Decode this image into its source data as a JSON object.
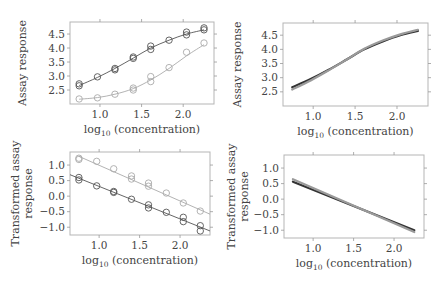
{
  "figure": {
    "xlabel_main": "log",
    "xlabel_sub": "10",
    "xlabel_rest": " (concentration)"
  },
  "chart_data": [
    {
      "id": "top-left",
      "type": "scatter",
      "title": "",
      "xlabel": "log10 (concentration)",
      "ylabel": [
        "Assay response"
      ],
      "xlim": [
        0.64,
        2.37
      ],
      "ylim": [
        2.0,
        4.93
      ],
      "xticks": [
        1.0,
        1.5,
        2.0
      ],
      "xtick_labels": [
        "1.0",
        "1.5",
        "2.0"
      ],
      "yticks": [
        2.5,
        3.0,
        3.5,
        4.0,
        4.5
      ],
      "ytick_labels": [
        "2.5",
        "3.0",
        "3.5",
        "4.0",
        "4.5"
      ],
      "grid": false,
      "box": {
        "x": 70,
        "y": 22,
        "w": 144,
        "h": 82
      },
      "series": [
        {
          "name": "reference",
          "color": "#555555",
          "marker": "circle",
          "fit": "logistic",
          "x": [
            0.75,
            0.75,
            0.97,
            1.18,
            1.18,
            1.4,
            1.4,
            1.61,
            1.61,
            1.83,
            2.04,
            2.04,
            2.25,
            2.25
          ],
          "y": [
            2.65,
            2.72,
            2.97,
            3.22,
            3.27,
            3.63,
            3.68,
            3.95,
            4.07,
            4.28,
            4.47,
            4.57,
            4.65,
            4.72
          ],
          "curve_x": [
            0.75,
            0.97,
            1.18,
            1.4,
            1.61,
            1.83,
            2.04,
            2.25
          ],
          "curve_y": [
            2.66,
            2.95,
            3.27,
            3.64,
            4.0,
            4.28,
            4.5,
            4.65
          ]
        },
        {
          "name": "test",
          "color": "#aaaaaa",
          "marker": "circle",
          "fit": "logistic",
          "x": [
            0.75,
            0.97,
            1.18,
            1.4,
            1.4,
            1.61,
            1.61,
            1.83,
            2.04,
            2.25
          ],
          "y": [
            2.18,
            2.22,
            2.35,
            2.5,
            2.57,
            2.8,
            2.98,
            3.3,
            3.85,
            4.18
          ],
          "curve_x": [
            0.75,
            0.97,
            1.18,
            1.4,
            1.61,
            1.83,
            2.04,
            2.25
          ],
          "curve_y": [
            2.17,
            2.23,
            2.35,
            2.55,
            2.86,
            3.27,
            3.72,
            4.12
          ]
        }
      ]
    },
    {
      "id": "top-right",
      "type": "line",
      "title": "",
      "xlabel": "log10 (concentration)",
      "ylabel": [
        "Assay response"
      ],
      "xlim": [
        0.64,
        2.37
      ],
      "ylim": [
        2.0,
        4.93
      ],
      "xticks": [
        1.0,
        1.5,
        2.0
      ],
      "xtick_labels": [
        "1.0",
        "1.5",
        "2.0"
      ],
      "yticks": [
        2.5,
        3.0,
        3.5,
        4.0,
        4.5
      ],
      "ytick_labels": [
        "2.5",
        "3.0",
        "3.5",
        "4.0",
        "4.5"
      ],
      "grid": false,
      "box": {
        "x": 283,
        "y": 23,
        "w": 145,
        "h": 83
      },
      "series": [
        {
          "name": "reference",
          "color": "#333333",
          "width": 2.2,
          "x": [
            0.75,
            0.97,
            1.18,
            1.4,
            1.61,
            1.83,
            2.04,
            2.25
          ],
          "y": [
            2.66,
            2.95,
            3.27,
            3.64,
            4.0,
            4.28,
            4.5,
            4.65
          ]
        },
        {
          "name": "test (shifted)",
          "color": "#9a9a9a",
          "width": 2.2,
          "x": [
            0.75,
            0.97,
            1.18,
            1.4,
            1.61,
            1.83,
            2.04,
            2.25
          ],
          "y": [
            2.58,
            2.9,
            3.25,
            3.64,
            4.02,
            4.31,
            4.53,
            4.69
          ]
        }
      ]
    },
    {
      "id": "bottom-left",
      "type": "scatter",
      "title": "",
      "xlabel": "log10 (concentration)",
      "ylabel": [
        "Transformed assay",
        "response"
      ],
      "xlim": [
        0.64,
        2.37
      ],
      "ylim": [
        -1.25,
        1.42
      ],
      "xticks": [
        1.0,
        1.5,
        2.0
      ],
      "xtick_labels": [
        "1.0",
        "1.5",
        "2.0"
      ],
      "yticks": [
        -1.0,
        -0.5,
        0.0,
        0.5,
        1.0
      ],
      "ytick_labels": [
        "−1.0",
        "−0.5",
        "0.0",
        "0.5",
        "1.0"
      ],
      "grid": false,
      "box": {
        "x": 70,
        "y": 152,
        "w": 140,
        "h": 83
      },
      "series": [
        {
          "name": "reference",
          "color": "#555555",
          "marker": "circle",
          "fit": "linear",
          "x": [
            0.75,
            0.75,
            0.97,
            1.18,
            1.18,
            1.4,
            1.61,
            1.61,
            1.83,
            2.04,
            2.04,
            2.25,
            2.25
          ],
          "y": [
            0.6,
            0.52,
            0.33,
            0.15,
            0.12,
            -0.1,
            -0.28,
            -0.38,
            -0.52,
            -0.68,
            -0.82,
            -0.95,
            -1.12
          ],
          "curve_x": [
            0.64,
            2.37
          ],
          "curve_y": [
            0.69,
            -1.12
          ]
        },
        {
          "name": "test",
          "color": "#aaaaaa",
          "marker": "circle",
          "fit": "linear",
          "x": [
            0.75,
            0.75,
            0.97,
            1.18,
            1.4,
            1.4,
            1.61,
            1.61,
            1.83,
            2.04,
            2.25
          ],
          "y": [
            1.22,
            1.18,
            1.12,
            0.88,
            0.65,
            0.55,
            0.42,
            0.32,
            0.1,
            -0.22,
            -0.48
          ],
          "curve_x": [
            0.75,
            2.37
          ],
          "curve_y": [
            1.28,
            -0.58
          ]
        }
      ]
    },
    {
      "id": "bottom-right",
      "type": "line",
      "title": "",
      "xlabel": "log10 (concentration)",
      "ylabel": [
        "Transformed assay",
        "response"
      ],
      "xlim": [
        0.64,
        2.37
      ],
      "ylim": [
        -1.25,
        1.42
      ],
      "xticks": [
        1.0,
        1.5,
        2.0
      ],
      "xtick_labels": [
        "1.0",
        "1.5",
        "2.0"
      ],
      "yticks": [
        -1.0,
        -0.5,
        0.0,
        0.5,
        1.0
      ],
      "ytick_labels": [
        "−1.0",
        "−0.5",
        "0.0",
        "0.5",
        "1.0"
      ],
      "grid": false,
      "box": {
        "x": 284,
        "y": 155,
        "w": 140,
        "h": 83
      },
      "series": [
        {
          "name": "reference",
          "color": "#333333",
          "width": 2.2,
          "x": [
            0.75,
            2.25
          ],
          "y": [
            0.56,
            -1.0
          ]
        },
        {
          "name": "test (shifted)",
          "color": "#9a9a9a",
          "width": 2.2,
          "x": [
            0.75,
            2.25
          ],
          "y": [
            0.64,
            -1.06
          ]
        }
      ]
    }
  ]
}
